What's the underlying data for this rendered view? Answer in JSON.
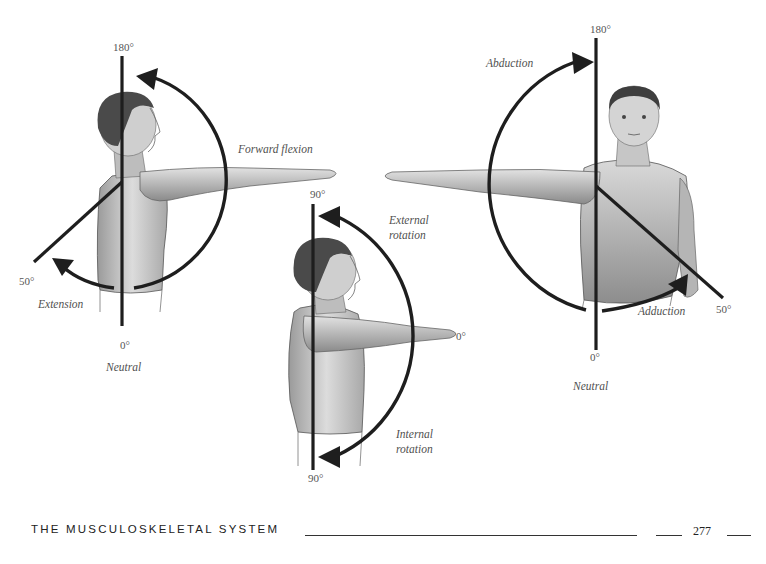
{
  "figure": {
    "left_panel": {
      "title": "Forward flexion / Extension",
      "labels": {
        "top_degree": "180°",
        "forward_flexion": "Forward flexion",
        "extension_degree": "50°",
        "extension": "Extension",
        "neutral_degree": "0°",
        "neutral": "Neutral"
      }
    },
    "middle_panel": {
      "title": "External / Internal rotation",
      "labels": {
        "top_degree": "90°",
        "external_rotation_line1": "External",
        "external_rotation_line2": "rotation",
        "arm_degree": "0°",
        "internal_rotation_line1": "Internal",
        "internal_rotation_line2": "rotation",
        "bottom_degree": "90°"
      }
    },
    "right_panel": {
      "title": "Abduction / Adduction",
      "labels": {
        "top_degree": "180°",
        "abduction": "Abduction",
        "adduction": "Adduction",
        "adduction_degree": "50°",
        "neutral_degree": "0°",
        "neutral": "Neutral"
      }
    }
  },
  "footer": {
    "section_title": "THE MUSCULOSKELETAL SYSTEM",
    "page_number": "277"
  }
}
